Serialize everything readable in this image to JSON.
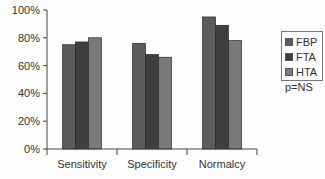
{
  "chart_data": {
    "type": "bar",
    "title": "",
    "xlabel": "",
    "ylabel": "",
    "ylim": [
      0,
      100
    ],
    "yticks": [
      "0%",
      "20%",
      "40%",
      "60%",
      "80%",
      "100%"
    ],
    "categories": [
      "Sensitivity",
      "Specificity",
      "Normalcy"
    ],
    "series": [
      {
        "name": "FBP",
        "color": "#5c5c5c",
        "values": [
          75,
          76,
          95
        ]
      },
      {
        "name": "FTA",
        "color": "#3e3e3e",
        "values": [
          77,
          68,
          89
        ]
      },
      {
        "name": "HTA",
        "color": "#7a7a7a",
        "values": [
          80,
          66,
          78
        ]
      }
    ],
    "grid": false,
    "legend_position": "right",
    "annotation": "p=NS"
  },
  "legend": {
    "items": [
      {
        "label": "FBP",
        "color": "#5c5c5c"
      },
      {
        "label": "FTA",
        "color": "#3e3e3e"
      },
      {
        "label": "HTA",
        "color": "#7a7a7a"
      }
    ]
  },
  "annotation": "p=NS"
}
